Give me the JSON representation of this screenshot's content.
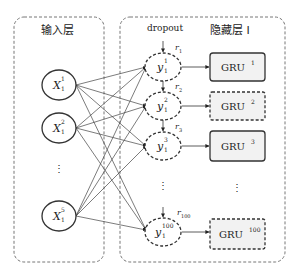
{
  "diagram": {
    "input_layer": {
      "title": "输入层",
      "nodes": [
        {
          "base": "X",
          "sup": "1",
          "sub": "1"
        },
        {
          "base": "X",
          "sup": "2",
          "sub": "1"
        },
        {
          "base": "X",
          "sup": "5",
          "sub": "1"
        }
      ],
      "ellipsis": "⋮"
    },
    "dropout": {
      "title": "dropout",
      "nodes": [
        {
          "base": "y",
          "sup": "1",
          "sub": "1",
          "r_base": "r",
          "r_sub": "1"
        },
        {
          "base": "y",
          "sup": "2",
          "sub": "1",
          "r_base": "r",
          "r_sub": "2"
        },
        {
          "base": "y",
          "sup": "3",
          "sub": "1",
          "r_base": "r",
          "r_sub": "3"
        },
        {
          "base": "y",
          "sup": "100",
          "sub": "1",
          "r_base": "r",
          "r_sub": "100"
        }
      ],
      "ellipsis": "⋮"
    },
    "hidden_layer": {
      "title": "隐藏层 I",
      "units": [
        {
          "base": "GRU",
          "sup": "1",
          "style": "solid"
        },
        {
          "base": "GRU",
          "sup": "2",
          "style": "dashed"
        },
        {
          "base": "GRU",
          "sup": "3",
          "style": "solid"
        },
        {
          "base": "GRU",
          "sup": "100",
          "style": "dashed"
        }
      ],
      "ellipsis": "⋮"
    },
    "colors": {
      "stroke": "#333333",
      "box_fill": "#f2f2f2",
      "frame": "#777777"
    }
  }
}
